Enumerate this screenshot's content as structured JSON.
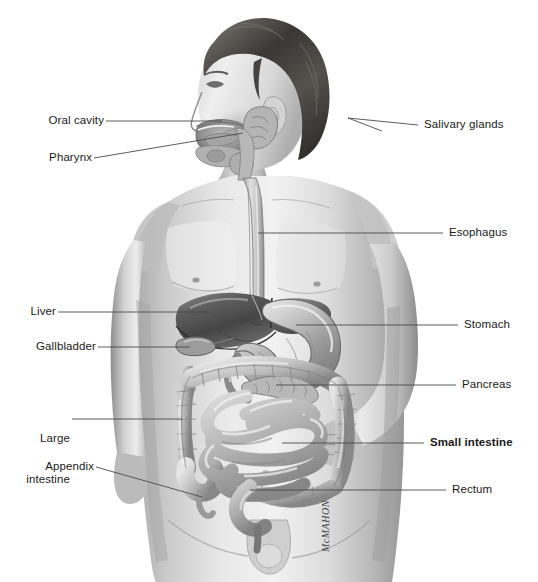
{
  "figure": {
    "style": "graphite pencil medical illustration, grayscale",
    "background_color": "#ffffff",
    "artist_signature": "McMAHON",
    "leader_line_color": "#4a4a4a",
    "label_color": "#1a1a1a"
  },
  "labels": {
    "left": [
      {
        "id": "oral-cavity",
        "text": "Oral cavity",
        "lines": [
          "Oral cavity"
        ],
        "bold": false
      },
      {
        "id": "pharynx",
        "text": "Pharynx",
        "lines": [
          "Pharynx"
        ],
        "bold": false
      },
      {
        "id": "liver",
        "text": "Liver",
        "lines": [
          "Liver"
        ],
        "bold": false
      },
      {
        "id": "gallbladder",
        "text": "Gallbladder",
        "lines": [
          "Gallbladder"
        ],
        "bold": false
      },
      {
        "id": "large-intestine",
        "text": "Large intestine",
        "lines": [
          "Large",
          "intestine"
        ],
        "bold": false
      },
      {
        "id": "appendix",
        "text": "Appendix",
        "lines": [
          "Appendix"
        ],
        "bold": false
      }
    ],
    "right": [
      {
        "id": "salivary-glands",
        "text": "Salivary glands",
        "lines": [
          "Salivary glands"
        ],
        "bold": false
      },
      {
        "id": "esophagus",
        "text": "Esophagus",
        "lines": [
          "Esophagus"
        ],
        "bold": false
      },
      {
        "id": "stomach",
        "text": "Stomach",
        "lines": [
          "Stomach"
        ],
        "bold": false
      },
      {
        "id": "pancreas",
        "text": "Pancreas",
        "lines": [
          "Pancreas"
        ],
        "bold": false
      },
      {
        "id": "small-intestine",
        "text": "Small intestine",
        "lines": [
          "Small intestine"
        ],
        "bold": true
      },
      {
        "id": "rectum",
        "text": "Rectum",
        "lines": [
          "Rectum"
        ],
        "bold": false
      }
    ]
  },
  "label_text": {
    "oral_cavity": "Oral cavity",
    "pharynx": "Pharynx",
    "liver": "Liver",
    "gallbladder": "Gallbladder",
    "large_intestine_line1": "Large",
    "large_intestine_line2": "intestine",
    "appendix": "Appendix",
    "salivary_glands": "Salivary glands",
    "esophagus": "Esophagus",
    "stomach": "Stomach",
    "pancreas": "Pancreas",
    "small_intestine": "Small intestine",
    "rectum": "Rectum",
    "signature": "McMAHON"
  },
  "organs": [
    {
      "name": "oral-cavity",
      "label": "Oral cavity"
    },
    {
      "name": "salivary-glands",
      "label": "Salivary glands"
    },
    {
      "name": "pharynx",
      "label": "Pharynx"
    },
    {
      "name": "esophagus",
      "label": "Esophagus"
    },
    {
      "name": "liver",
      "label": "Liver"
    },
    {
      "name": "gallbladder",
      "label": "Gallbladder"
    },
    {
      "name": "stomach",
      "label": "Stomach"
    },
    {
      "name": "pancreas",
      "label": "Pancreas"
    },
    {
      "name": "small-intestine",
      "label": "Small intestine"
    },
    {
      "name": "large-intestine",
      "label": "Large intestine"
    },
    {
      "name": "appendix",
      "label": "Appendix"
    },
    {
      "name": "rectum",
      "label": "Rectum"
    }
  ]
}
